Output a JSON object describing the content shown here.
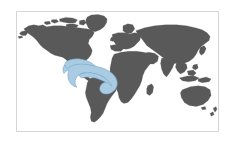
{
  "figure": {
    "type": "world-distribution-map",
    "title": "",
    "caption": "",
    "width": 234,
    "height": 143,
    "background_color": "#ffffff"
  },
  "map": {
    "projection": "equirectangular",
    "frame": {
      "x": 16,
      "y": 11,
      "width": 203,
      "height": 121,
      "border_color": "#d6d6d6",
      "border_width": 1,
      "ocean_color": "#ffffff"
    },
    "land": {
      "name": "world-landmasses",
      "fill_color": "#595959",
      "stroke_color": "#595959"
    },
    "highlight": {
      "name": "distribution-range",
      "label": "",
      "fill_color": "#a9cce3",
      "stroke_color": "#6f9fc8",
      "stroke_width": 0.8,
      "region_description": "Gulf of Mexico, Caribbean Sea, western tropical Atlantic and northern South America coastal waters"
    },
    "legend": {
      "visible": false,
      "entries": []
    },
    "graticule": {
      "visible": false
    },
    "labels": []
  }
}
